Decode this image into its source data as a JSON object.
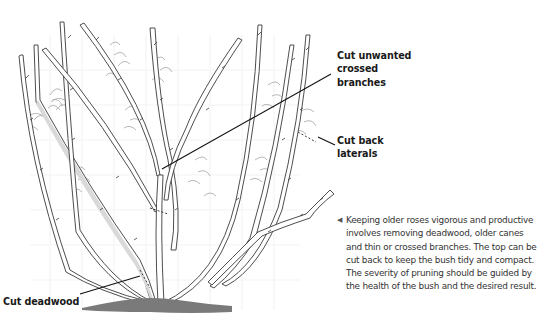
{
  "labels": {
    "crossed": {
      "lines": [
        "Cut unwanted",
        "crossed",
        "branches"
      ]
    },
    "laterals": {
      "lines": [
        "Cut back",
        "laterals"
      ]
    },
    "deadwood": {
      "lines": [
        "Cut deadwood"
      ]
    }
  },
  "caption": {
    "arrow_icon": "◀",
    "lines": [
      "Keeping older roses vigorous and productive",
      "involves removing deadwood, older canes",
      "and thin or crossed branches. The top can be",
      "cut back to keep the bush tidy and compact.",
      "The severity of pruning should be guided by",
      "the health of the bush and the desired result."
    ]
  },
  "colors": {
    "stem_outline": "#3a3a3a",
    "stem_fill": "#ffffff",
    "deadwood_fill": "#d9d9d9",
    "leaf_outline": "#9a9a9a",
    "ground": "#7a7a7a",
    "leader": "#111111",
    "grid": "#f2f2f2"
  }
}
